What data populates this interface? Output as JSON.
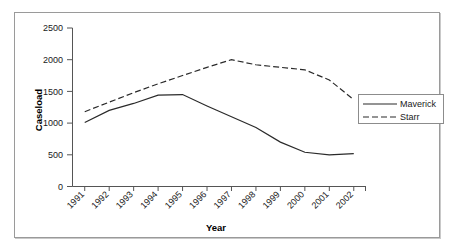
{
  "chart_data": {
    "type": "line",
    "title": "",
    "xlabel": "Year",
    "ylabel": "Caseload",
    "x": [
      "1991",
      "1992",
      "1993",
      "1994",
      "1995",
      "1996",
      "1997",
      "1998",
      "1999",
      "2000",
      "2001",
      "2002"
    ],
    "xlim": [
      1991,
      2002
    ],
    "ylim": [
      0,
      2500
    ],
    "yticks": [
      0,
      500,
      1000,
      1500,
      2000,
      2500
    ],
    "ytick_labels": [
      "0",
      "500",
      "1000",
      "1500",
      "2000",
      "2500"
    ],
    "grid": false,
    "legend_position": "right",
    "series": [
      {
        "name": "Maverick",
        "style": "solid",
        "color": "#2a2a2a",
        "values": [
          1010,
          1200,
          1310,
          1440,
          1450,
          1270,
          1100,
          930,
          700,
          540,
          500,
          520
        ]
      },
      {
        "name": "Starr",
        "style": "dashed",
        "color": "#2a2a2a",
        "values": [
          1180,
          1330,
          1480,
          1620,
          1750,
          1880,
          2000,
          1920,
          1880,
          1840,
          1680,
          1370
        ]
      }
    ]
  },
  "axes": {
    "ylabel": "Caseload",
    "xlabel": "Year"
  },
  "legend": {
    "items": [
      {
        "label": "Maverick"
      },
      {
        "label": "Starr"
      }
    ]
  }
}
